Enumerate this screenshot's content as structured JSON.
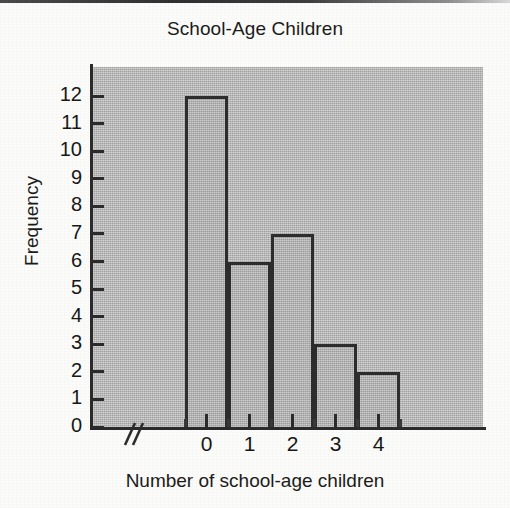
{
  "chart_data": {
    "type": "bar",
    "title": "School-Age Children",
    "xlabel": "Number of school-age children",
    "ylabel": "Frequency",
    "categories": [
      "0",
      "1",
      "2",
      "3",
      "4"
    ],
    "values": [
      12,
      6,
      7,
      3,
      2
    ],
    "ylim": [
      0,
      12
    ],
    "ytick_labels": [
      "0",
      "1",
      "2",
      "3",
      "4",
      "5",
      "6",
      "7",
      "8",
      "9",
      "10",
      "11",
      "12"
    ],
    "ytick_values": [
      0,
      1,
      2,
      3,
      4,
      5,
      6,
      7,
      8,
      9,
      10,
      11,
      12
    ],
    "xtick_labels": [
      "0",
      "1",
      "2",
      "3",
      "4"
    ],
    "grid": false,
    "legend": "none",
    "annotations": [
      "axis-break on x-axis near origin"
    ],
    "colors": {
      "plot_background": "#b2b2b2",
      "bar_fill": "#b0b0b0",
      "bar_outline": "#2d2d2d",
      "axis": "#2b2b2b",
      "text": "#171717",
      "page_background": "#fbfbf9"
    }
  },
  "axis_break": {
    "symbol": "//",
    "name": "axis-break-marker"
  }
}
